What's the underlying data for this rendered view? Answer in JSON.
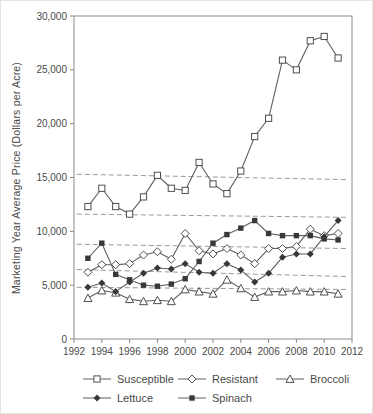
{
  "chart_data": {
    "type": "line",
    "title": "",
    "xlabel": "",
    "ylabel": "Marketing Year Average Price (Dollars per Acre)",
    "x_range": [
      1992,
      2012
    ],
    "ylim": [
      0,
      30000
    ],
    "grid": false,
    "legend_position": "bottom",
    "x_ticks": [
      1992,
      1994,
      1996,
      1998,
      2000,
      2002,
      2004,
      2006,
      2008,
      2010,
      2012
    ],
    "y_ticks": [
      {
        "value": 0,
        "label": "0"
      },
      {
        "value": 5000,
        "label": "5,000"
      },
      {
        "value": 10000,
        "label": "10,000"
      },
      {
        "value": 15000,
        "label": "15,000"
      },
      {
        "value": 20000,
        "label": "20,000"
      },
      {
        "value": 25000,
        "label": "25,000"
      },
      {
        "value": 30000,
        "label": "30,000"
      }
    ],
    "x": [
      1993,
      1994,
      1995,
      1996,
      1997,
      1998,
      1999,
      2000,
      2001,
      2002,
      2003,
      2004,
      2005,
      2006,
      2007,
      2008,
      2009,
      2010,
      2011
    ],
    "series": [
      {
        "name": "Susceptible",
        "marker": "open-square",
        "values": [
          12300,
          14000,
          12300,
          11600,
          13200,
          15200,
          14000,
          13800,
          16400,
          14400,
          13500,
          15600,
          18800,
          20500,
          25900,
          25000,
          27700,
          28100,
          26100
        ]
      },
      {
        "name": "Resistant",
        "marker": "open-diamond",
        "values": [
          6200,
          6900,
          6900,
          7000,
          7800,
          8100,
          7400,
          9800,
          8200,
          7900,
          8400,
          7800,
          7000,
          8400,
          8400,
          8600,
          10200,
          9600,
          9800
        ]
      },
      {
        "name": "Broccoli",
        "marker": "open-triangle",
        "values": [
          3800,
          4500,
          4300,
          3700,
          3500,
          3600,
          3500,
          4600,
          4400,
          4200,
          5500,
          4700,
          3900,
          4400,
          4400,
          4500,
          4400,
          4400,
          4200
        ]
      },
      {
        "name": "Lettuce",
        "marker": "filled-diamond",
        "values": [
          4800,
          5200,
          4400,
          5300,
          6100,
          6600,
          6500,
          7000,
          6200,
          6100,
          7000,
          6400,
          5300,
          6100,
          7600,
          7900,
          7900,
          9500,
          11000
        ]
      },
      {
        "name": "Spinach",
        "marker": "filled-square",
        "values": [
          7500,
          8900,
          6000,
          5500,
          5000,
          4900,
          5100,
          5600,
          7200,
          8900,
          9700,
          10300,
          11000,
          9800,
          9600,
          9600,
          9600,
          9300,
          9200
        ]
      }
    ],
    "trend_lines": [
      {
        "x1": 1992.2,
        "y1": 15300,
        "x2": 2011.7,
        "y2": 14800
      },
      {
        "x1": 1992.2,
        "y1": 11600,
        "x2": 2011.7,
        "y2": 11300
      },
      {
        "x1": 1992.2,
        "y1": 8800,
        "x2": 2011.7,
        "y2": 8400
      },
      {
        "x1": 1992.2,
        "y1": 6450,
        "x2": 2011.7,
        "y2": 5800
      },
      {
        "x1": 1992.2,
        "y1": 4800,
        "x2": 2011.7,
        "y2": 4600
      }
    ]
  },
  "legend": {
    "items": [
      {
        "id": "susceptible",
        "label": "Susceptible",
        "marker": "open-square"
      },
      {
        "id": "resistant",
        "label": "Resistant",
        "marker": "open-diamond"
      },
      {
        "id": "broccoli",
        "label": "Broccoli",
        "marker": "open-triangle"
      },
      {
        "id": "lettuce",
        "label": "Lettuce",
        "marker": "filled-diamond"
      },
      {
        "id": "spinach",
        "label": "Spinach",
        "marker": "filled-square"
      }
    ]
  },
  "colors": {
    "line": "#5f5f5f",
    "marker_stroke": "#4f4f4f",
    "marker_fill_dark": "#383838",
    "marker_fill_open": "#ffffff",
    "axis": "#8a8a8a",
    "trend": "#9a9a9a",
    "text": "#4a4a4a",
    "background": "#ffffff"
  }
}
